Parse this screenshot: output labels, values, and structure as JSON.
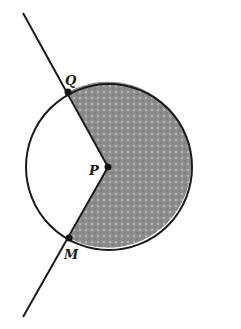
{
  "figure": {
    "type": "geometry-diagram",
    "colors": {
      "stroke": "#1a1a1a",
      "shade": "#8a8a8a",
      "background": "#ffffff"
    },
    "points": {
      "Q": {
        "label": "Q",
        "x": 68,
        "y": 92
      },
      "P": {
        "label": "P",
        "x": 108,
        "y": 167
      },
      "M": {
        "label": "M",
        "x": 69,
        "y": 238
      }
    },
    "circle": {
      "center": "P",
      "cx": 109,
      "cy": 167,
      "r": 83
    },
    "line": {
      "x1": 23,
      "y1": 13,
      "x2": 23,
      "y2": 317
    },
    "shaded_region": "sector QPM (major arc side, right)"
  }
}
